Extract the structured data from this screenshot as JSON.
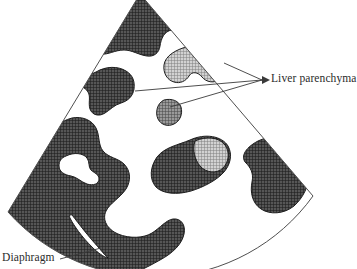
{
  "figure": {
    "type": "ultrasound-sector-schematic",
    "background_color": "#ffffff",
    "outline_color": "#4a4a4a",
    "dark_tissue_color": "#4e4e4e",
    "mid_tissue_color": "#6e6e6e",
    "light_tissue_color": "#a8a8a8",
    "anechoic_color": "#ffffff"
  },
  "labels": {
    "liver_parenchyma": "Liver parenchyma",
    "diaphragm": "Diaphragm"
  },
  "leader_lines": {
    "liver_parenchyma_hub": "262,80",
    "liver_parenchyma_targets": [
      "135,91",
      "225,63",
      "170,107"
    ],
    "diaphragm_hub": "62,258",
    "diaphragm_target": "100,249"
  },
  "sector": {
    "apex": "140,-4",
    "left_edge_end": "8,212",
    "right_edge_end": "312,196",
    "arc_label": "far-field-arc"
  },
  "regions": [
    {
      "name": "upper-dark-mass",
      "tone": "dark"
    },
    {
      "name": "upper-left-dark-blob",
      "tone": "dark"
    },
    {
      "name": "kidney-light-blob",
      "tone": "light"
    },
    {
      "name": "small-mid-blob",
      "tone": "mid"
    },
    {
      "name": "central-dark-blob",
      "tone": "dark"
    },
    {
      "name": "central-light-patch",
      "tone": "light"
    },
    {
      "name": "right-dark-mass",
      "tone": "dark"
    },
    {
      "name": "lower-left-dark-mass",
      "tone": "dark"
    },
    {
      "name": "anechoic-hole",
      "tone": "anechoic"
    },
    {
      "name": "diaphragm-sliver",
      "tone": "anechoic"
    }
  ]
}
